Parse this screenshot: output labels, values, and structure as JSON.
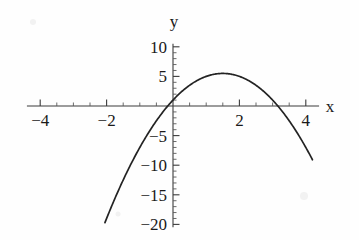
{
  "chart_data": {
    "type": "line",
    "title": "",
    "subtitle": "",
    "xlabel": "x",
    "ylabel": "y",
    "xlim": [
      -4.4,
      4.4
    ],
    "ylim": [
      -20.5,
      10.5
    ],
    "grid": false,
    "legend": null,
    "x_ticks": [
      -4,
      -2,
      2,
      4
    ],
    "x_tick_labels": [
      "−4",
      "−2",
      "2",
      "4"
    ],
    "x_minor_tick_step": 0.5,
    "y_ticks": [
      10,
      5,
      -5,
      -10,
      -15,
      -20
    ],
    "y_tick_labels": [
      "10",
      "5",
      "−5",
      "−10",
      "−15",
      "−20"
    ],
    "y_minor_tick_step": 1,
    "series": [
      {
        "name": "parabola",
        "equation": "y = -2x^2 + 6x + 1",
        "color": "#232323",
        "x_start": -2.05,
        "x_end": 4.2,
        "vertex": [
          1.5,
          5.5
        ],
        "y_intercept": 1,
        "roots": [
          -0.16,
          3.16
        ],
        "points": [
          [
            -2.05,
            -19.7
          ],
          [
            -1.8,
            -16.3
          ],
          [
            -1.6,
            -13.7
          ],
          [
            -1.4,
            -11.3
          ],
          [
            -1.2,
            -9.1
          ],
          [
            -1.0,
            -7.0
          ],
          [
            -0.8,
            -5.1
          ],
          [
            -0.6,
            -3.3
          ],
          [
            -0.4,
            -1.7
          ],
          [
            -0.2,
            -0.3
          ],
          [
            0.0,
            1.0
          ],
          [
            0.2,
            2.1
          ],
          [
            0.4,
            3.1
          ],
          [
            0.6,
            3.9
          ],
          [
            0.8,
            4.5
          ],
          [
            1.0,
            5.0
          ],
          [
            1.2,
            5.3
          ],
          [
            1.4,
            5.5
          ],
          [
            1.5,
            5.5
          ],
          [
            1.6,
            5.5
          ],
          [
            1.8,
            5.3
          ],
          [
            2.0,
            5.0
          ],
          [
            2.2,
            4.5
          ],
          [
            2.4,
            3.9
          ],
          [
            2.6,
            3.1
          ],
          [
            2.8,
            2.1
          ],
          [
            3.0,
            1.0
          ],
          [
            3.2,
            -0.3
          ],
          [
            3.4,
            -1.7
          ],
          [
            3.6,
            -3.3
          ],
          [
            3.8,
            -5.1
          ],
          [
            4.0,
            -7.0
          ],
          [
            4.2,
            -7.4
          ]
        ]
      }
    ]
  },
  "axes": {
    "x_axis_label": "x",
    "y_axis_label": "y"
  },
  "colors": {
    "curve": "#232323",
    "axis": "#3b3b3b",
    "text": "#1a1a1a",
    "background": "#fefefe"
  }
}
